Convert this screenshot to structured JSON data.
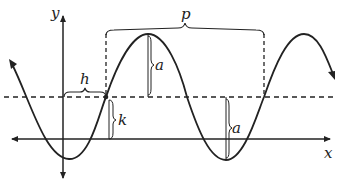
{
  "diagram": {
    "type": "sinusoid-parameters",
    "labels": {
      "y_axis": "y",
      "x_axis": "x",
      "period": "p",
      "horizontal_shift": "h",
      "vertical_shift": "k",
      "amplitude_top": "a",
      "amplitude_bottom": "a"
    },
    "colors": {
      "stroke": "#222222",
      "background": "#ffffff"
    }
  }
}
